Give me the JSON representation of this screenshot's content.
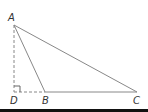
{
  "diagram": {
    "type": "triangle-with-altitude",
    "points": {
      "A": {
        "label": "A",
        "x": 14,
        "y": 25
      },
      "B": {
        "label": "B",
        "x": 45,
        "y": 92
      },
      "C": {
        "label": "C",
        "x": 137,
        "y": 92
      },
      "D": {
        "label": "D",
        "x": 14,
        "y": 92
      }
    },
    "segments": [
      {
        "from": "A",
        "to": "B",
        "style": "solid"
      },
      {
        "from": "A",
        "to": "C",
        "style": "solid"
      },
      {
        "from": "B",
        "to": "C",
        "style": "solid"
      },
      {
        "from": "A",
        "to": "D",
        "style": "dashed"
      },
      {
        "from": "D",
        "to": "B",
        "style": "dashed"
      }
    ],
    "right_angle_at": "D",
    "colors": {
      "line": "#888888",
      "label": "#333333"
    }
  }
}
